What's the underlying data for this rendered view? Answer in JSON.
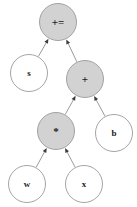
{
  "canvas": {
    "width": 137,
    "height": 207,
    "background": "#ffffff"
  },
  "style": {
    "filled_fill": "#d2d2d2",
    "open_fill": "#ffffff",
    "node_stroke": "#9a9a9a",
    "edge_stroke": "#8f8f8f",
    "arrow_fill": "#3a3a3a",
    "label_color": "#1a1a1a"
  },
  "graph": {
    "type": "tree",
    "title": "",
    "edge_direction": "child-to-parent",
    "nodes": [
      {
        "id": "n0",
        "label": "+=",
        "cx": 58,
        "cy": 22,
        "r": 18.5,
        "fill": "filled",
        "font_size": 11,
        "level": 0
      },
      {
        "id": "n1",
        "label": "s",
        "cx": 29,
        "cy": 73,
        "r": 18.5,
        "fill": "open",
        "font_size": 9,
        "level": 1
      },
      {
        "id": "n2",
        "label": "+",
        "cx": 85,
        "cy": 79,
        "r": 18.5,
        "fill": "filled",
        "font_size": 11,
        "level": 1
      },
      {
        "id": "n3",
        "label": "*",
        "cx": 56,
        "cy": 131,
        "r": 18.5,
        "fill": "filled",
        "font_size": 11,
        "level": 2
      },
      {
        "id": "n4",
        "label": "b",
        "cx": 114,
        "cy": 133,
        "r": 18.5,
        "fill": "open",
        "font_size": 9,
        "level": 2
      },
      {
        "id": "n5",
        "label": "w",
        "cx": 27,
        "cy": 184,
        "r": 18.5,
        "fill": "open",
        "font_size": 9,
        "level": 3
      },
      {
        "id": "n6",
        "label": "x",
        "cx": 84,
        "cy": 184,
        "r": 18.5,
        "fill": "open",
        "font_size": 9,
        "level": 3
      }
    ],
    "edges": [
      {
        "from": "n1",
        "to": "n0",
        "arrow": "to"
      },
      {
        "from": "n2",
        "to": "n0",
        "arrow": "to"
      },
      {
        "from": "n3",
        "to": "n2",
        "arrow": "to"
      },
      {
        "from": "n4",
        "to": "n2",
        "arrow": "to"
      },
      {
        "from": "n5",
        "to": "n3",
        "arrow": "to"
      },
      {
        "from": "n6",
        "to": "n3",
        "arrow": "to"
      }
    ]
  }
}
